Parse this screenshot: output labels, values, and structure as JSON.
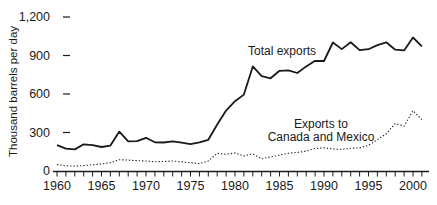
{
  "chart_data": {
    "type": "line",
    "title": "",
    "xlabel": "",
    "ylabel": "Thousand barrels per day",
    "ylim": [
      0,
      1200
    ],
    "x_start": 1960,
    "x_end": 2001,
    "grid": false,
    "legend_position": "inline-annotations",
    "background_color": "#ffffff",
    "line_color": "#1a1a1a",
    "x_tick_labels": [
      "1960",
      "1965",
      "1970",
      "1975",
      "1980",
      "1985",
      "1990",
      "1995",
      "2000"
    ],
    "y_ticks": [
      0,
      300,
      600,
      900,
      1200
    ],
    "y_tick_labels": [
      "0",
      "300",
      "600",
      "900",
      "1,200"
    ],
    "years": [
      1960,
      1961,
      1962,
      1963,
      1964,
      1965,
      1966,
      1967,
      1968,
      1969,
      1970,
      1971,
      1972,
      1973,
      1974,
      1975,
      1976,
      1977,
      1978,
      1979,
      1980,
      1981,
      1982,
      1983,
      1984,
      1985,
      1986,
      1987,
      1988,
      1989,
      1990,
      1991,
      1992,
      1993,
      1994,
      1995,
      1996,
      1997,
      1998,
      1999,
      2000,
      2001
    ],
    "series": [
      {
        "name": "Total exports",
        "style": "solid",
        "annotation_lines": [
          "Total exports"
        ],
        "values": [
          202,
          174,
          168,
          208,
          202,
          187,
          198,
          307,
          231,
          233,
          259,
          224,
          222,
          231,
          221,
          209,
          223,
          243,
          362,
          471,
          544,
          595,
          815,
          739,
          722,
          781,
          785,
          764,
          815,
          859,
          857,
          1001,
          950,
          1003,
          942,
          949,
          981,
          1003,
          945,
          940,
          1040,
          971
        ]
      },
      {
        "name": "Exports to Canada and Mexico",
        "style": "dotted",
        "annotation_lines": [
          "Exports to",
          "Canada and Mexico"
        ],
        "values": [
          50,
          40,
          38,
          42,
          48,
          55,
          65,
          88,
          85,
          80,
          78,
          72,
          75,
          78,
          72,
          65,
          58,
          78,
          138,
          130,
          140,
          118,
          133,
          95,
          110,
          125,
          138,
          145,
          155,
          175,
          180,
          172,
          168,
          178,
          180,
          200,
          245,
          290,
          370,
          350,
          470,
          400
        ]
      }
    ]
  }
}
